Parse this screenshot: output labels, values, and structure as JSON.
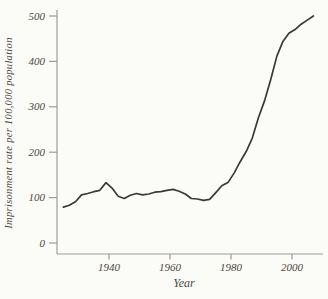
{
  "figure": {
    "background": "#fbfbf8",
    "axis_color": "#9d9d99",
    "line_color": "#3a3a3a",
    "text_color": "#4b4942"
  },
  "chart_data": {
    "type": "line",
    "title": "",
    "xlabel": "Year",
    "ylabel": "Imprisonment rate per 100,000 population",
    "x_ticks": [
      1940,
      1960,
      1980,
      2000
    ],
    "y_ticks": [
      0,
      100,
      200,
      300,
      400,
      500
    ],
    "xlim": [
      1922,
      2009
    ],
    "ylim": [
      0,
      500
    ],
    "grid": false,
    "legend": false,
    "series": [
      {
        "x": [
          1925,
          1927,
          1929,
          1931,
          1933,
          1935,
          1937,
          1939,
          1941,
          1943,
          1945,
          1947,
          1949,
          1951,
          1953,
          1955,
          1957,
          1959,
          1961,
          1963,
          1965,
          1967,
          1969,
          1971,
          1973,
          1975,
          1977,
          1979,
          1981,
          1983,
          1985,
          1987,
          1989,
          1991,
          1993,
          1995,
          1997,
          1999,
          2001,
          2003,
          2005,
          2007
        ],
        "y": [
          79,
          83,
          91,
          106,
          109,
          113,
          116,
          133,
          121,
          103,
          98,
          105,
          109,
          106,
          108,
          112,
          113,
          116,
          118,
          114,
          108,
          98,
          97,
          94,
          96,
          111,
          126,
          133,
          154,
          179,
          202,
          231,
          276,
          313,
          359,
          411,
          444,
          462,
          470,
          482,
          491,
          500
        ]
      }
    ]
  }
}
